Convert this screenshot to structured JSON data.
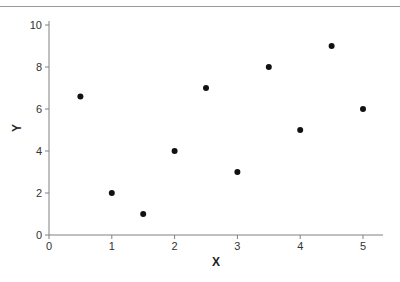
{
  "chart_data": {
    "type": "scatter",
    "title": "",
    "xlabel": "X",
    "ylabel": "Y",
    "xlim": [
      0,
      5.3
    ],
    "ylim": [
      0,
      10
    ],
    "xticks": [
      0,
      1,
      2,
      3,
      4,
      5
    ],
    "yticks": [
      0,
      2,
      4,
      6,
      8,
      10
    ],
    "grid": false,
    "legend": null,
    "series": [
      {
        "name": "points",
        "marker_color": "#111111",
        "points": [
          {
            "x": 0.5,
            "y": 6.6
          },
          {
            "x": 1.0,
            "y": 2.0
          },
          {
            "x": 1.5,
            "y": 1.0
          },
          {
            "x": 2.0,
            "y": 4.0
          },
          {
            "x": 2.5,
            "y": 7.0
          },
          {
            "x": 3.0,
            "y": 3.0
          },
          {
            "x": 3.5,
            "y": 8.0
          },
          {
            "x": 4.0,
            "y": 5.0
          },
          {
            "x": 4.5,
            "y": 9.0
          },
          {
            "x": 5.0,
            "y": 6.0
          }
        ]
      }
    ]
  },
  "axes": {
    "x_title": "X",
    "y_title": "Y",
    "x_tick_labels": [
      "0",
      "1",
      "2",
      "3",
      "4",
      "5"
    ],
    "y_tick_labels": [
      "0",
      "2",
      "4",
      "6",
      "8",
      "10"
    ]
  },
  "colors": {
    "axis": "#808080",
    "marker": "#111111",
    "text": "#333333"
  }
}
